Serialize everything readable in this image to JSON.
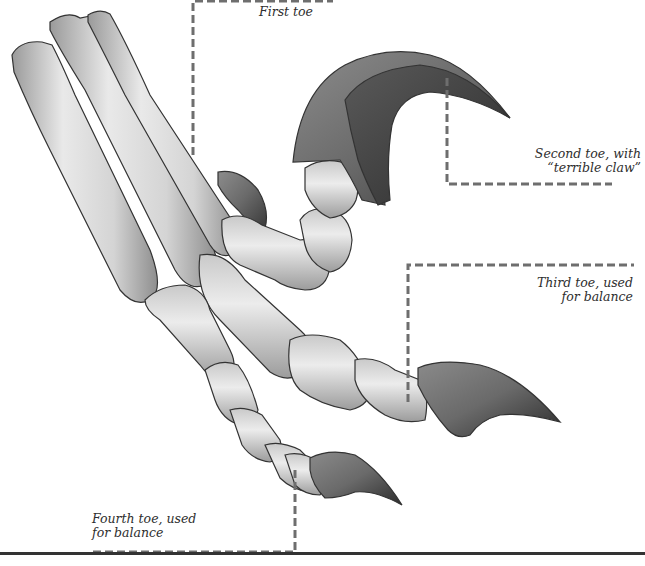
{
  "figure": {
    "colors": {
      "background": "#ffffff",
      "bone_light": "#e6e6e6",
      "bone_mid": "#b9b9b9",
      "bone_outline": "#333333",
      "claw_dark": "#4a4a4a",
      "claw_mid": "#7d7d7d",
      "callout_line": "#6e6e6e",
      "label_text": "#2e2e2e",
      "bottom_rule": "#333333"
    }
  },
  "labels": {
    "first_toe": {
      "lines": [
        "First toe"
      ]
    },
    "second_toe": {
      "lines": [
        "Second toe, with",
        "“terrible claw”"
      ]
    },
    "third_toe": {
      "lines": [
        "Third toe, used",
        "for balance"
      ]
    },
    "fourth_toe": {
      "lines": [
        "Fourth toe, used",
        "for balance"
      ]
    }
  }
}
